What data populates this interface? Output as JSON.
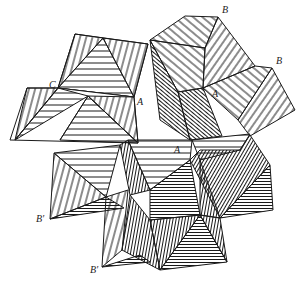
{
  "figure": {
    "labels": [
      {
        "id": "B_top",
        "text": "B",
        "x": 222,
        "y": 9
      },
      {
        "id": "B_right",
        "text": "B",
        "x": 275,
        "y": 56
      },
      {
        "id": "C",
        "text": "C",
        "x": 49,
        "y": 80
      },
      {
        "id": "A_left",
        "text": "A",
        "x": 137,
        "y": 97
      },
      {
        "id": "A_right",
        "text": "A",
        "x": 212,
        "y": 89
      },
      {
        "id": "A_center",
        "text": "A",
        "x": 174,
        "y": 146
      },
      {
        "id": "B_prime_upper",
        "text": "B′",
        "x": 36,
        "y": 214
      },
      {
        "id": "B_prime_lower",
        "text": "B′",
        "x": 90,
        "y": 266
      }
    ],
    "colors": {
      "line": "#1a1a1a",
      "background": "#ffffff"
    }
  }
}
